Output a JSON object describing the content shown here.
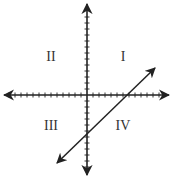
{
  "diagram": {
    "type": "coordinate-plane",
    "colors": {
      "axis": "#222222",
      "line": "#222222",
      "label": "#333333",
      "background": "#ffffff"
    },
    "origin_px": {
      "x": 87,
      "y": 95
    },
    "tick_spacing_px": 6,
    "x_axis": {
      "ticks_negative": 13,
      "ticks_positive": 12,
      "arrows": "both"
    },
    "y_axis": {
      "ticks_positive": 13,
      "ticks_negative": 12,
      "arrows": "both"
    },
    "quadrants": [
      {
        "id": "I",
        "label": "I",
        "x": 123,
        "y": 57
      },
      {
        "id": "II",
        "label": "II",
        "x": 51,
        "y": 57
      },
      {
        "id": "III",
        "label": "III",
        "x": 51,
        "y": 126
      },
      {
        "id": "IV",
        "label": "IV",
        "x": 123,
        "y": 126
      }
    ],
    "line": {
      "description": "Line with positive slope, arrows at both ends, passing through quadrants III, IV and I",
      "x_intercept_ticks": 6,
      "y_intercept_ticks": -5,
      "start_px": {
        "x": 57,
        "y": 163
      },
      "end_px": {
        "x": 155,
        "y": 68
      },
      "arrows": "both"
    }
  }
}
